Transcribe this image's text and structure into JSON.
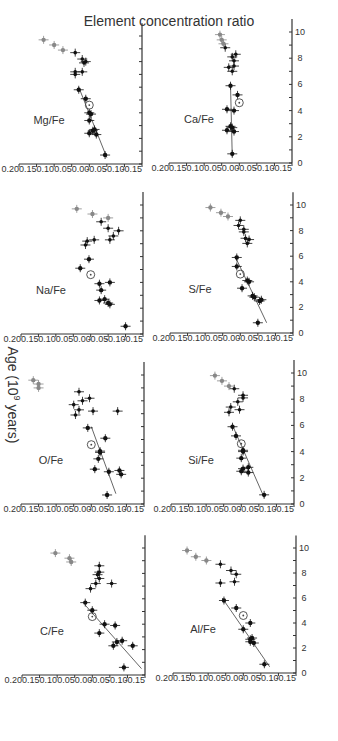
{
  "figure": {
    "orientation": "rotated-90",
    "y_axis_title": "Element concentration ratio",
    "x_axis_title": "Age (10",
    "x_axis_title_sup": "9",
    "x_axis_title_end": " years)",
    "colors": {
      "axis": "#333333",
      "point_black": "#111111",
      "point_gray": "#888888",
      "fit_line": "#555555"
    }
  },
  "chart_data": [
    {
      "type": "scatter",
      "title": "C/Fe",
      "xlabel": "Age (10^9 years)",
      "ylabel": "Element concentration ratio",
      "xlim": [
        0,
        11
      ],
      "ylim": [
        -0.15,
        0.2
      ],
      "xticks": [
        0,
        2,
        4,
        6,
        8,
        10
      ],
      "yticks": [
        "0.20",
        "0.15",
        "0.10",
        "0.05",
        "0.00",
        "-0.05",
        "-0.10",
        "-0.15"
      ],
      "sun": {
        "x": 4.6,
        "y": 0.0
      },
      "fit": [
        [
          0.5,
          -0.14
        ],
        [
          5.5,
          0.02
        ]
      ],
      "series": [
        {
          "name": "thin disk (black)",
          "points": [
            [
              0.6,
              -0.09
            ],
            [
              2.3,
              -0.06
            ],
            [
              2.3,
              -0.115
            ],
            [
              2.6,
              -0.07
            ],
            [
              2.7,
              -0.085
            ],
            [
              3.3,
              -0.02
            ],
            [
              3.9,
              -0.065
            ],
            [
              4.0,
              -0.035
            ],
            [
              5.1,
              0.0
            ],
            [
              5.7,
              0.02
            ]
          ]
        },
        {
          "name": "intermediate",
          "points": [
            [
              6.8,
              0.005
            ],
            [
              7.2,
              -0.01
            ],
            [
              7.2,
              -0.055
            ],
            [
              7.6,
              -0.02
            ],
            [
              7.9,
              -0.015
            ],
            [
              8.1,
              -0.02
            ],
            [
              8.6,
              -0.02
            ]
          ]
        },
        {
          "name": "thick disk (gray)",
          "points": [
            [
              8.9,
              0.06
            ],
            [
              9.2,
              0.065
            ],
            [
              9.6,
              0.105
            ]
          ]
        }
      ]
    },
    {
      "type": "scatter",
      "title": "Al/Fe",
      "xlabel": "Age (10^9 years)",
      "ylabel": "Element concentration ratio",
      "xlim": [
        0,
        11
      ],
      "ylim": [
        -0.15,
        0.2
      ],
      "xticks": [
        0,
        2,
        4,
        6,
        8,
        10
      ],
      "yticks": [
        "0.20",
        "0.15",
        "0.10",
        "0.05",
        "0.00",
        "-0.05",
        "-0.10",
        "-0.15"
      ],
      "sun": {
        "x": 4.6,
        "y": 0.0
      },
      "fit": [
        [
          0.5,
          -0.075
        ],
        [
          6.0,
          0.06
        ]
      ],
      "series": [
        {
          "name": "thin disk (black)",
          "points": [
            [
              0.7,
              -0.06
            ],
            [
              2.4,
              -0.03
            ],
            [
              2.5,
              -0.02
            ],
            [
              2.7,
              -0.02
            ],
            [
              2.8,
              -0.025
            ],
            [
              3.5,
              0.0
            ],
            [
              4.0,
              -0.02
            ],
            [
              5.2,
              0.02
            ],
            [
              5.8,
              0.055
            ]
          ]
        },
        {
          "name": "intermediate",
          "points": [
            [
              7.2,
              0.065
            ],
            [
              7.3,
              0.025
            ],
            [
              7.9,
              0.02
            ],
            [
              8.2,
              0.035
            ],
            [
              8.7,
              0.065
            ]
          ]
        },
        {
          "name": "thick disk (gray)",
          "points": [
            [
              9.0,
              0.105
            ],
            [
              9.3,
              0.135
            ],
            [
              9.8,
              0.16
            ]
          ]
        }
      ]
    },
    {
      "type": "scatter",
      "title": "O/Fe",
      "xlabel": "Age (10^9 years)",
      "ylabel": "Element concentration ratio",
      "xlim": [
        0,
        11
      ],
      "ylim": [
        -0.15,
        0.2
      ],
      "xticks": [
        0,
        2,
        4,
        6,
        8,
        10
      ],
      "yticks": [
        "0.20",
        "0.15",
        "0.10",
        "0.05",
        "0.00",
        "-0.05",
        "-0.10",
        "-0.15"
      ],
      "sun": {
        "x": 4.6,
        "y": 0.0
      },
      "fit": [
        [
          0.8,
          -0.07
        ],
        [
          6.0,
          0.0
        ]
      ],
      "series": [
        {
          "name": "thin disk (black)",
          "points": [
            [
              0.7,
              -0.045
            ],
            [
              2.3,
              -0.085
            ],
            [
              2.5,
              -0.05
            ],
            [
              2.6,
              -0.08
            ],
            [
              2.7,
              -0.01
            ],
            [
              3.5,
              -0.02
            ],
            [
              4.0,
              -0.025
            ],
            [
              4.1,
              -0.025
            ],
            [
              5.1,
              -0.04
            ],
            [
              5.9,
              0.01
            ]
          ]
        },
        {
          "name": "intermediate",
          "points": [
            [
              6.9,
              0.045
            ],
            [
              7.2,
              -0.005
            ],
            [
              7.2,
              -0.075
            ],
            [
              7.3,
              0.035
            ],
            [
              7.7,
              0.05
            ],
            [
              8.0,
              0.025
            ],
            [
              8.2,
              0.005
            ],
            [
              8.7,
              0.035
            ]
          ]
        },
        {
          "name": "thick disk (gray)",
          "points": [
            [
              9.0,
              0.15
            ],
            [
              9.3,
              0.15
            ],
            [
              9.6,
              0.165
            ]
          ]
        }
      ]
    },
    {
      "type": "scatter",
      "title": "Si/Fe",
      "xlabel": "Age (10^9 years)",
      "ylabel": "Element concentration ratio",
      "xlim": [
        0,
        11
      ],
      "ylim": [
        -0.15,
        0.2
      ],
      "xticks": [
        0,
        2,
        4,
        6,
        8,
        10
      ],
      "yticks": [
        "0.20",
        "0.15",
        "0.10",
        "0.05",
        "0.00",
        "-0.05",
        "-0.10",
        "-0.15"
      ],
      "sun": {
        "x": 4.6,
        "y": 0.0
      },
      "fit": [
        [
          0.5,
          -0.065
        ],
        [
          6.0,
          0.025
        ]
      ],
      "series": [
        {
          "name": "thin disk (black)",
          "points": [
            [
              0.7,
              -0.065
            ],
            [
              2.4,
              -0.02
            ],
            [
              2.5,
              0.0
            ],
            [
              2.7,
              -0.005
            ],
            [
              2.8,
              -0.02
            ],
            [
              3.5,
              0.0
            ],
            [
              4.0,
              -0.005
            ],
            [
              4.1,
              -0.005
            ],
            [
              5.2,
              0.015
            ],
            [
              5.9,
              0.025
            ]
          ]
        },
        {
          "name": "intermediate",
          "points": [
            [
              7.0,
              0.035
            ],
            [
              7.2,
              0.005
            ],
            [
              7.4,
              0.03
            ],
            [
              7.8,
              0.01
            ],
            [
              8.1,
              -0.005
            ],
            [
              8.3,
              -0.005
            ],
            [
              8.8,
              0.02
            ]
          ]
        },
        {
          "name": "thick disk (gray)",
          "points": [
            [
              9.0,
              0.035
            ],
            [
              9.4,
              0.055
            ],
            [
              9.8,
              0.075
            ]
          ]
        }
      ]
    },
    {
      "type": "scatter",
      "title": "Na/Fe",
      "xlabel": "Age (10^9 years)",
      "ylabel": "Element concentration ratio",
      "xlim": [
        0,
        11
      ],
      "ylim": [
        -0.15,
        0.2
      ],
      "xticks": [
        0,
        2,
        4,
        6,
        8,
        10
      ],
      "yticks": [
        "0.20",
        "0.15",
        "0.10",
        "0.05",
        "0.00",
        "-0.05",
        "-0.10",
        "-0.15"
      ],
      "sun": {
        "x": 4.6,
        "y": 0.0
      },
      "fit": null,
      "series": [
        {
          "name": "thin disk (black)",
          "points": [
            [
              0.6,
              -0.1
            ],
            [
              2.3,
              -0.055
            ],
            [
              2.4,
              -0.05
            ],
            [
              2.6,
              -0.025
            ],
            [
              2.7,
              -0.04
            ],
            [
              3.4,
              -0.03
            ],
            [
              3.9,
              -0.025
            ],
            [
              4.0,
              -0.055
            ],
            [
              5.1,
              0.03
            ],
            [
              5.8,
              0.005
            ]
          ]
        },
        {
          "name": "intermediate",
          "points": [
            [
              6.9,
              0.015
            ],
            [
              7.2,
              0.01
            ],
            [
              7.3,
              -0.01
            ],
            [
              7.3,
              -0.055
            ],
            [
              7.6,
              -0.065
            ],
            [
              8.0,
              -0.08
            ],
            [
              8.2,
              -0.05
            ],
            [
              8.7,
              -0.03
            ]
          ]
        },
        {
          "name": "thick disk (gray)",
          "points": [
            [
              9.0,
              -0.05
            ],
            [
              9.3,
              -0.005
            ],
            [
              9.7,
              0.04
            ]
          ]
        }
      ]
    },
    {
      "type": "scatter",
      "title": "S/Fe",
      "xlabel": "Age (10^9 years)",
      "ylabel": "Element concentration ratio",
      "xlim": [
        0,
        11
      ],
      "ylim": [
        -0.15,
        0.2
      ],
      "xticks": [
        0,
        2,
        4,
        6,
        8,
        10
      ],
      "yticks": [
        "0.20",
        "0.15",
        "0.10",
        "0.05",
        "0.00",
        "-0.05",
        "-0.10",
        "-0.15"
      ],
      "sun": {
        "x": 4.6,
        "y": 0.0
      },
      "fit": [
        [
          0.8,
          -0.075
        ],
        [
          6.0,
          0.015
        ]
      ],
      "series": [
        {
          "name": "thin disk (black)",
          "points": [
            [
              0.8,
              -0.05
            ],
            [
              2.5,
              -0.055
            ],
            [
              2.6,
              -0.06
            ],
            [
              2.8,
              -0.04
            ],
            [
              2.9,
              -0.035
            ],
            [
              3.5,
              -0.005
            ],
            [
              4.0,
              -0.025
            ],
            [
              4.1,
              -0.02
            ],
            [
              5.2,
              0.01
            ],
            [
              5.9,
              0.01
            ]
          ]
        },
        {
          "name": "intermediate",
          "points": [
            [
              7.0,
              -0.02
            ],
            [
              7.3,
              -0.025
            ],
            [
              7.4,
              -0.015
            ],
            [
              7.9,
              -0.01
            ],
            [
              8.1,
              -0.01
            ],
            [
              8.4,
              0.005
            ],
            [
              8.8,
              0.0
            ]
          ]
        },
        {
          "name": "thick disk (gray)",
          "points": [
            [
              9.1,
              0.035
            ],
            [
              9.4,
              0.055
            ],
            [
              9.8,
              0.085
            ]
          ]
        }
      ]
    },
    {
      "type": "scatter",
      "title": "Mg/Fe",
      "xlabel": "Age (10^9 years)",
      "ylabel": "Element concentration ratio",
      "xlim": [
        0,
        11
      ],
      "ylim": [
        -0.15,
        0.2
      ],
      "xticks": [
        0,
        2,
        4,
        6,
        8,
        10
      ],
      "yticks": [
        "0.20",
        "0.15",
        "0.10",
        "0.05",
        "0.00",
        "-0.05",
        "-0.10",
        "-0.15"
      ],
      "sun": {
        "x": 4.6,
        "y": 0.0
      },
      "fit": [
        [
          0.5,
          -0.05
        ],
        [
          6.0,
          0.03
        ]
      ],
      "series": [
        {
          "name": "thin disk (black)",
          "points": [
            [
              0.7,
              -0.045
            ],
            [
              2.3,
              -0.02
            ],
            [
              2.4,
              0.0
            ],
            [
              2.6,
              -0.01
            ],
            [
              2.7,
              -0.015
            ],
            [
              3.4,
              0.0
            ],
            [
              3.9,
              -0.005
            ],
            [
              4.0,
              0.0
            ],
            [
              5.1,
              0.01
            ],
            [
              5.8,
              0.03
            ]
          ]
        },
        {
          "name": "intermediate",
          "points": [
            [
              7.0,
              0.04
            ],
            [
              7.2,
              0.02
            ],
            [
              7.2,
              0.04
            ],
            [
              7.9,
              0.015
            ],
            [
              8.0,
              0.01
            ],
            [
              8.2,
              0.02
            ],
            [
              8.7,
              0.04
            ]
          ]
        },
        {
          "name": "thick disk (gray)",
          "points": [
            [
              8.9,
              0.075
            ],
            [
              9.3,
              0.1
            ],
            [
              9.7,
              0.13
            ]
          ]
        }
      ]
    },
    {
      "type": "scatter",
      "title": "Ca/Fe",
      "xlabel": "Age (10^9 years)",
      "ylabel": "Element concentration ratio",
      "xlim": [
        0,
        11
      ],
      "ylim": [
        -0.15,
        0.2
      ],
      "xticks": [
        0,
        2,
        4,
        6,
        8,
        10
      ],
      "yticks": [
        "0.20",
        "0.15",
        "0.10",
        "0.05",
        "0.00",
        "-0.05",
        "-0.10",
        "-0.15"
      ],
      "sun": {
        "x": 4.6,
        "y": 0.0
      },
      "fit": [
        [
          0.5,
          0.02
        ],
        [
          6.0,
          0.025
        ]
      ],
      "series": [
        {
          "name": "thin disk (black)",
          "points": [
            [
              0.7,
              0.02
            ],
            [
              2.4,
              0.015
            ],
            [
              2.5,
              0.035
            ],
            [
              2.7,
              0.02
            ],
            [
              2.8,
              0.025
            ],
            [
              4.0,
              0.015
            ],
            [
              4.1,
              0.035
            ],
            [
              5.2,
              0.005
            ],
            [
              5.9,
              0.025
            ]
          ]
        },
        {
          "name": "intermediate",
          "points": [
            [
              7.0,
              0.02
            ],
            [
              7.3,
              0.03
            ],
            [
              7.4,
              0.015
            ],
            [
              7.8,
              0.015
            ],
            [
              8.1,
              0.02
            ],
            [
              8.3,
              0.01
            ],
            [
              8.8,
              0.04
            ]
          ]
        },
        {
          "name": "thick disk (gray)",
          "points": [
            [
              9.1,
              0.045
            ],
            [
              9.4,
              0.05
            ],
            [
              9.8,
              0.055
            ]
          ]
        }
      ]
    }
  ]
}
